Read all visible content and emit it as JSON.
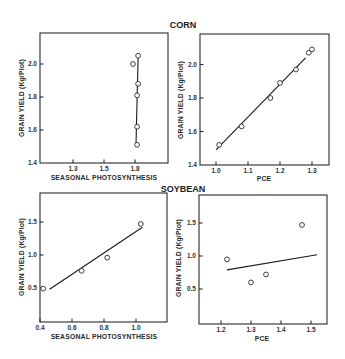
{
  "titles": {
    "corn": "CORN",
    "soybean": "SOYBEAN"
  },
  "colors": {
    "ink": "#2a2a2a",
    "background": "#ffffff"
  },
  "chart_data": [
    {
      "id": "corn-sp",
      "group": "CORN",
      "type": "scatter",
      "title": "",
      "xlabel": "SEASONAL PHOTOSYNTHESIS",
      "ylabel": "GRAIN YIELD (Kg/Plot)",
      "xticks": [
        "1.3",
        "1.5",
        "1.8"
      ],
      "yticks": [
        "1.4",
        "1.6",
        "1.8",
        "2.0"
      ],
      "ylim": [
        1.4,
        2.15
      ],
      "points": [
        [
          1.78,
          2.0
        ],
        [
          1.83,
          2.05
        ],
        [
          1.83,
          1.88
        ],
        [
          1.82,
          1.81
        ],
        [
          1.82,
          1.62
        ],
        [
          1.82,
          1.51
        ]
      ],
      "fit_line": [
        [
          1.83,
          2.04
        ],
        [
          1.81,
          1.52
        ]
      ],
      "grid": false
    },
    {
      "id": "corn-pce",
      "group": "CORN",
      "type": "scatter",
      "title": "",
      "xlabel": "PCE",
      "ylabel": "GRAIN YIELD (Kg/Plot)",
      "xticks": [
        "1.0",
        "1.1",
        "1.2",
        "1.3"
      ],
      "yticks": [
        "1.4",
        "1.6",
        "1.8",
        "2.0"
      ],
      "xlim": [
        0.95,
        1.35
      ],
      "ylim": [
        1.4,
        2.15
      ],
      "points": [
        [
          1.01,
          1.52
        ],
        [
          1.08,
          1.63
        ],
        [
          1.17,
          1.8
        ],
        [
          1.2,
          1.89
        ],
        [
          1.25,
          1.97
        ],
        [
          1.29,
          2.07
        ],
        [
          1.3,
          2.09
        ]
      ],
      "fit_line": [
        [
          1.0,
          1.49
        ],
        [
          1.28,
          2.04
        ]
      ],
      "grid": false
    },
    {
      "id": "soy-sp",
      "group": "SOYBEAN",
      "type": "scatter",
      "title": "",
      "xlabel": "SEASONAL PHOTOSYNTHESIS",
      "ylabel": "GRAIN YIELD (Kg/Plot)",
      "xticks": [
        "0.4",
        "0.6",
        "0.8",
        "1.0"
      ],
      "yticks": [
        "0.5",
        "1.0",
        "1.5"
      ],
      "xlim": [
        0.4,
        1.2
      ],
      "ylim": [
        0.0,
        1.9
      ],
      "points": [
        [
          0.42,
          0.49
        ],
        [
          0.66,
          0.76
        ],
        [
          0.82,
          0.96
        ],
        [
          1.03,
          1.47
        ]
      ],
      "fit_line": [
        [
          0.46,
          0.48
        ],
        [
          1.04,
          1.42
        ]
      ],
      "grid": false
    },
    {
      "id": "soy-pce",
      "group": "SOYBEAN",
      "type": "scatter",
      "title": "",
      "xlabel": "PCE",
      "ylabel": "GRAIN YIELD (Kg/Plot)",
      "xticks": [
        "1.2",
        "1.3",
        "1.4",
        "1.5"
      ],
      "yticks": [
        "0.5",
        "1.0",
        "1.5"
      ],
      "xlim": [
        1.13,
        1.55
      ],
      "ylim": [
        0.0,
        1.9
      ],
      "points": [
        [
          1.22,
          0.95
        ],
        [
          1.3,
          0.6
        ],
        [
          1.35,
          0.72
        ],
        [
          1.47,
          1.47
        ]
      ],
      "fit_line": [
        [
          1.22,
          0.79
        ],
        [
          1.52,
          1.02
        ]
      ],
      "grid": false
    }
  ]
}
